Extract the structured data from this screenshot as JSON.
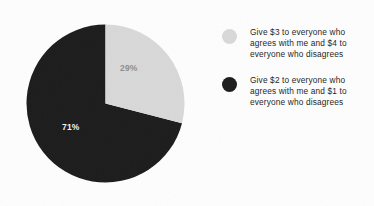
{
  "chart_data": {
    "type": "pie",
    "title": "",
    "categories": [
      "Give $3 to everyone who agrees with me and $4 to everyone who disagrees",
      "Give $2 to everyone who agrees with me and $1 to everyone who disagrees"
    ],
    "values": [
      29,
      71
    ],
    "value_labels": [
      "29%",
      "71%"
    ],
    "colors": [
      "#d8d8d8",
      "#1c1c1c"
    ],
    "legend_position": "right",
    "start_angle_deg": 0,
    "direction": "clockwise",
    "grid": false,
    "xlabel": "",
    "ylabel": ""
  },
  "pie": {
    "slices": [
      {
        "name": "give-3-and-4",
        "percent_label": "29%",
        "value": 29,
        "color": "#d8d8d8",
        "label_color": "#8e8e8e"
      },
      {
        "name": "give-2-and-1",
        "percent_label": "71%",
        "value": 71,
        "color": "#1c1c1c",
        "label_color": "#f2f2f2"
      }
    ]
  },
  "legend": {
    "items": [
      {
        "swatch_color": "#d8d8d8",
        "swatch_name": "legend-swatch-light",
        "label": "Give $3 to everyone who agrees with me and $4 to everyone who disagrees"
      },
      {
        "swatch_color": "#1c1c1c",
        "swatch_name": "legend-swatch-dark",
        "label": "Give $2 to everyone who agrees with me and $1 to everyone who disagrees"
      }
    ]
  },
  "colors": {
    "background": "#fdfdfd",
    "light_slice": "#d8d8d8",
    "dark_slice": "#1c1c1c",
    "text": "#1d1d1d"
  }
}
